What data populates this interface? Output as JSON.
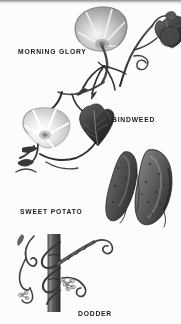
{
  "plate": {
    "title": "Morning-glory family botanical plate",
    "style": "vintage halftone black-and-white engraving",
    "background_color": "#f7f7f5",
    "ink_color": "#242424",
    "width": 181,
    "height": 324
  },
  "top_band": {
    "name": "page-edge-band",
    "color": "#8e8e8e"
  },
  "specimens": [
    {
      "id": "morning-glory",
      "label": "MORNING GLORY",
      "label_x": 18,
      "label_y": 52,
      "description": "Trumpet-shaped flower with five-pointed star throat, heart-shaped leaf, twining stem and coiling tendrils",
      "flower_color": "#b6b6b6",
      "leaf_color": "#5d5d5d"
    },
    {
      "id": "bindweed",
      "label": "BINDWEED",
      "label_x": 112,
      "label_y": 119,
      "description": "Pale white funnel flower with ribbed petals beside a dark arrowhead leaf on a twining vine",
      "flower_color": "#e2e2e0",
      "leaf_color": "#4a4a4a"
    },
    {
      "id": "sweet-potato",
      "label": "SWEET POTATO",
      "label_x": 20,
      "label_y": 210,
      "description": "Pair of dark tapered speckled tubers",
      "tuber_color": "#595959"
    },
    {
      "id": "dodder",
      "label": "DODDER",
      "label_x": 78,
      "label_y": 312,
      "description": "Leafless parasitic vine twining around an upright host stem with small flower clusters and haustoria",
      "stem_color": "#6b6b6b",
      "vine_color": "#4f4f4f"
    }
  ]
}
